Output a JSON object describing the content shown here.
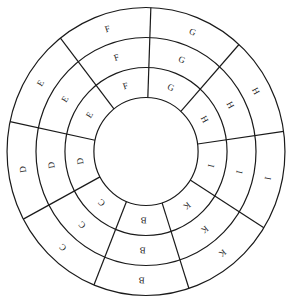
{
  "diagram": {
    "type": "concentric-sector-wheel",
    "center": [
      146,
      151.5
    ],
    "scale_x": 0.965,
    "radii": [
      54,
      84,
      114,
      144
    ],
    "boundary_angles_deg": [
      8,
      48,
      88,
      128,
      168,
      208,
      248,
      288,
      328
    ],
    "colors": {
      "stroke": "#1a1a1a",
      "text": "#222222",
      "background": "#ffffff"
    },
    "sectors": [
      {
        "label": "H",
        "rings": [
          "H",
          "H",
          "H"
        ]
      },
      {
        "label": "G",
        "rings": [
          "G",
          "G",
          "G"
        ]
      },
      {
        "label": "F",
        "rings": [
          "F",
          "F",
          "F"
        ]
      },
      {
        "label": "E",
        "rings": [
          "E",
          "E",
          "E"
        ]
      },
      {
        "label": "D",
        "rings": [
          "D",
          "D",
          "D"
        ]
      },
      {
        "label": "C",
        "rings": [
          "C",
          "C",
          "C"
        ]
      },
      {
        "label": "B",
        "rings": [
          "B",
          "B",
          "B"
        ]
      },
      {
        "label": "K",
        "rings": [
          "K",
          "K",
          "K"
        ]
      },
      {
        "label": "I",
        "rings": [
          "I",
          "I",
          "I"
        ]
      }
    ]
  }
}
